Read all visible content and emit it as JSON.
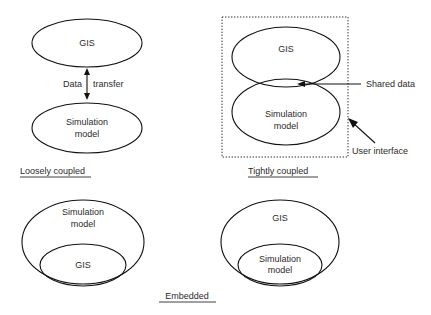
{
  "diagram": {
    "title_visible": false,
    "background_color": "#ffffff",
    "line_color": "#111111",
    "text_color": "#2b2b2b",
    "panels": [
      {
        "id": "loosely-coupled",
        "caption": "Loosely coupled",
        "shapes": [
          {
            "name": "gis-ellipse",
            "label": "GIS"
          },
          {
            "name": "simulation-model-ellipse",
            "label_line1": "Simulation",
            "label_line2": "model"
          }
        ],
        "annotations": [
          {
            "name": "data-transfer-left",
            "text": "Data"
          },
          {
            "name": "data-transfer-right",
            "text": "transfer"
          }
        ]
      },
      {
        "id": "tightly-coupled",
        "caption": "Tightly coupled",
        "shapes": [
          {
            "name": "gis-ellipse",
            "label": "GIS"
          },
          {
            "name": "simulation-model-ellipse",
            "label_line1": "Simulation",
            "label_line2": "model"
          },
          {
            "name": "user-interface-box",
            "label": ""
          }
        ],
        "annotations": [
          {
            "name": "shared-data-callout",
            "text": "Shared data"
          },
          {
            "name": "user-interface-callout",
            "text": "User interface"
          }
        ]
      },
      {
        "id": "embedded-gis-in-model",
        "caption": "",
        "shapes": [
          {
            "name": "simulation-model-outer-ellipse",
            "label_line1": "Simulation",
            "label_line2": "model"
          },
          {
            "name": "gis-inner-ellipse",
            "label": "GIS"
          }
        ],
        "annotations": []
      },
      {
        "id": "embedded-model-in-gis",
        "caption": "",
        "shapes": [
          {
            "name": "gis-outer-ellipse",
            "label": "GIS"
          },
          {
            "name": "simulation-model-inner-ellipse",
            "label_line1": "Simulation",
            "label_line2": "model"
          }
        ],
        "annotations": []
      }
    ],
    "captions": {
      "loosely_coupled": "Loosely coupled",
      "tightly_coupled": "Tightly coupled",
      "embedded": "Embedded"
    },
    "labels": {
      "gis": "GIS",
      "simulation_line1": "Simulation",
      "simulation_line2": "model",
      "data": "Data",
      "transfer": "transfer",
      "shared_data": "Shared data",
      "user_interface": "User interface"
    }
  }
}
